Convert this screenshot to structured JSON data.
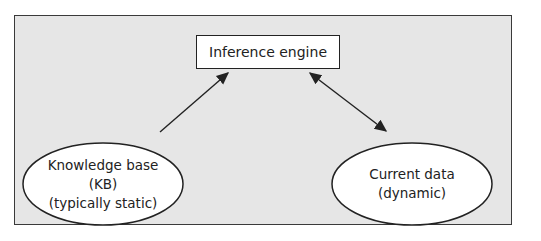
{
  "diagram": {
    "background": "#e6e6e6",
    "nodes": {
      "engine": {
        "label": "Inference engine",
        "shape": "rectangle"
      },
      "kb": {
        "lines": [
          "Knowledge base",
          "(KB)",
          "(typically static)"
        ],
        "shape": "ellipse"
      },
      "data": {
        "lines": [
          "Current data",
          "(dynamic)"
        ],
        "shape": "ellipse"
      }
    },
    "edges": [
      {
        "from": "kb",
        "to": "engine",
        "direction": "one-way"
      },
      {
        "from": "data",
        "to": "engine",
        "direction": "two-way"
      }
    ]
  }
}
